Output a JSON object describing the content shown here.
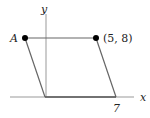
{
  "diagram": {
    "type": "parallelogram-on-axes",
    "axes": {
      "x_label": "x",
      "y_label": "y"
    },
    "points": [
      {
        "name": "A",
        "label": "A",
        "marked": true
      },
      {
        "name": "P",
        "label": "(5, 8)",
        "marked": true
      }
    ],
    "tick_labels": [
      {
        "axis": "x",
        "label": "7"
      }
    ],
    "colors": {
      "line": "#555555",
      "axis": "#888888",
      "point": "#000000"
    }
  }
}
